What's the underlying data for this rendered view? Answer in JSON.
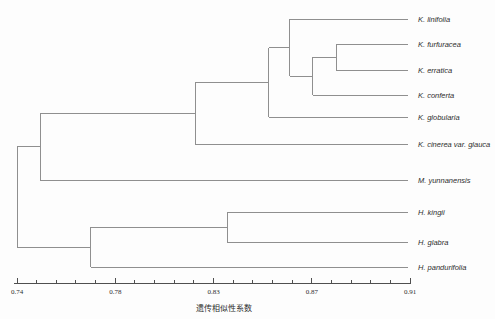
{
  "figure": {
    "background": "#fdfdfd",
    "tree_line_color": "#8f8f8f",
    "axis_color": "#4f4f4f",
    "text_color": "#2e2e2e"
  },
  "chart_data": {
    "type": "dendrogram",
    "orientation": "horizontal-right-leaves",
    "title": "",
    "xlabel": "遗传相似性系数",
    "axis": {
      "min": 0.74,
      "max": 0.91,
      "tick_labels": [
        "0.74",
        "0.78",
        "0.83",
        "0.87",
        "0.91"
      ],
      "tick_values": [
        0.74,
        0.7825,
        0.825,
        0.8675,
        0.91
      ],
      "minor_divisions": 5
    },
    "leaves": [
      "K. linifolia",
      "K. furfuracea",
      "K. erratica",
      "K. conferta",
      "K. globularia",
      "K. cinerea var. glauca",
      "M. yunnanensis",
      "H. kingii",
      "H. glabra",
      "H. pandurifolia"
    ],
    "tree": {
      "similarity": 0.74,
      "children": [
        {
          "similarity": 0.75,
          "children": [
            {
              "similarity": 0.817,
              "children": [
                {
                  "similarity": 0.849,
                  "children": [
                    {
                      "similarity": 0.858,
                      "children": [
                        {
                          "leaf": "K. linifolia"
                        },
                        {
                          "similarity": 0.868,
                          "children": [
                            {
                              "similarity": 0.878,
                              "children": [
                                {
                                  "leaf": "K. furfuracea"
                                },
                                {
                                  "leaf": "K. erratica"
                                }
                              ]
                            },
                            {
                              "leaf": "K. conferta"
                            }
                          ]
                        }
                      ]
                    },
                    {
                      "leaf": "K. globularia"
                    }
                  ]
                },
                {
                  "leaf": "K. cinerea var. glauca"
                }
              ]
            },
            {
              "leaf": "M. yunnanensis"
            }
          ]
        },
        {
          "similarity": 0.772,
          "children": [
            {
              "similarity": 0.831,
              "children": [
                {
                  "leaf": "H. kingii"
                },
                {
                  "leaf": "H. glabra"
                }
              ]
            },
            {
              "leaf": "H. pandurifolia"
            }
          ]
        }
      ]
    },
    "layout": {
      "leaf_y": [
        19,
        44,
        70,
        95,
        117,
        144,
        180,
        212,
        242,
        267
      ],
      "axis_x_range": [
        17,
        410
      ],
      "axis_line_x": [
        14,
        411
      ],
      "axis_y": 283,
      "leaf_end_x": 408,
      "label_x": 418,
      "tick_label_baseline_y": 294,
      "major_tick_h": 5,
      "minor_tick_h": 3,
      "xlabel_center_x": 224,
      "xlabel_baseline_y": 311
    }
  }
}
